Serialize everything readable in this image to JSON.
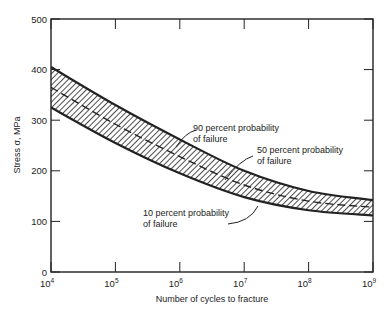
{
  "chart_data": {
    "type": "line",
    "title": "",
    "xlabel": "Number of cycles to fracture",
    "ylabel": "Stress σ, MPa",
    "xscale": "log",
    "xlim": [
      10000,
      1000000000
    ],
    "ylim": [
      0,
      500
    ],
    "x_ticks": [
      {
        "value": 10000,
        "base": "10",
        "exp": "4"
      },
      {
        "value": 100000,
        "base": "10",
        "exp": "5"
      },
      {
        "value": 1000000,
        "base": "10",
        "exp": "6"
      },
      {
        "value": 10000000,
        "base": "10",
        "exp": "7"
      },
      {
        "value": 100000000,
        "base": "10",
        "exp": "8"
      },
      {
        "value": 1000000000,
        "base": "10",
        "exp": "9"
      }
    ],
    "y_ticks": [
      0,
      100,
      200,
      300,
      400,
      500
    ],
    "grid": false,
    "x": [
      10000,
      100000,
      1000000,
      10000000,
      100000000,
      1000000000
    ],
    "series": [
      {
        "name": "90 percent probability of failure",
        "style": "solid",
        "values": [
          405,
          330,
          262,
          200,
          160,
          142
        ]
      },
      {
        "name": "50 percent probability of failure",
        "style": "dashed",
        "values": [
          365,
          292,
          228,
          172,
          140,
          128
        ]
      },
      {
        "name": "10 percent probability of failure",
        "style": "solid",
        "values": [
          325,
          255,
          195,
          148,
          122,
          112
        ]
      }
    ],
    "band": {
      "between": [
        "90 percent probability of failure",
        "10 percent probability of failure"
      ],
      "fill": "hatched"
    },
    "annotations": [
      {
        "line1": "90 percent probability",
        "line2": "of failure"
      },
      {
        "line1": "50 percent probability",
        "line2": "of failure"
      },
      {
        "line1": "10 percent probability",
        "line2": "of failure"
      }
    ]
  }
}
